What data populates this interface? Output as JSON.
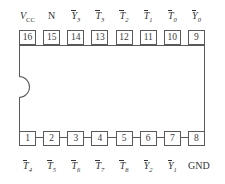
{
  "diagram": {
    "package": {
      "pin_count": 16,
      "notch": "left-edge-semicircle"
    },
    "colors": {
      "outline": "#58595b",
      "text": "#333335",
      "background": "#ffffff"
    },
    "top_row": {
      "pins": [
        {
          "number": "16",
          "base": "V",
          "sub": "CC",
          "overline": false,
          "italic": true,
          "smallcap_sub": true
        },
        {
          "number": "15",
          "base": "N",
          "sub": "",
          "overline": false,
          "italic": false,
          "smallcap_sub": false
        },
        {
          "number": "14",
          "base": "Y",
          "sub": "3",
          "overline": true,
          "italic": true,
          "smallcap_sub": false
        },
        {
          "number": "13",
          "base": "T",
          "sub": "3",
          "overline": true,
          "italic": true,
          "smallcap_sub": false
        },
        {
          "number": "12",
          "base": "T",
          "sub": "2",
          "overline": true,
          "italic": true,
          "smallcap_sub": false
        },
        {
          "number": "11",
          "base": "T",
          "sub": "1",
          "overline": true,
          "italic": true,
          "smallcap_sub": false
        },
        {
          "number": "10",
          "base": "T",
          "sub": "0",
          "overline": true,
          "italic": true,
          "smallcap_sub": false
        },
        {
          "number": "9",
          "base": "Y",
          "sub": "0",
          "overline": true,
          "italic": true,
          "smallcap_sub": false
        }
      ]
    },
    "bottom_row": {
      "pins": [
        {
          "number": "1",
          "base": "T",
          "sub": "4",
          "overline": true,
          "italic": true,
          "smallcap_sub": false
        },
        {
          "number": "2",
          "base": "T",
          "sub": "5",
          "overline": true,
          "italic": true,
          "smallcap_sub": false
        },
        {
          "number": "3",
          "base": "T",
          "sub": "6",
          "overline": true,
          "italic": true,
          "smallcap_sub": false
        },
        {
          "number": "4",
          "base": "T",
          "sub": "7",
          "overline": true,
          "italic": true,
          "smallcap_sub": false
        },
        {
          "number": "5",
          "base": "T",
          "sub": "8",
          "overline": true,
          "italic": true,
          "smallcap_sub": false
        },
        {
          "number": "6",
          "base": "Y",
          "sub": "2",
          "overline": true,
          "italic": true,
          "smallcap_sub": false
        },
        {
          "number": "7",
          "base": "Y",
          "sub": "1",
          "overline": true,
          "italic": true,
          "smallcap_sub": false
        },
        {
          "number": "8",
          "base": "GND",
          "sub": "",
          "overline": false,
          "italic": false,
          "smallcap_sub": false
        }
      ]
    }
  }
}
